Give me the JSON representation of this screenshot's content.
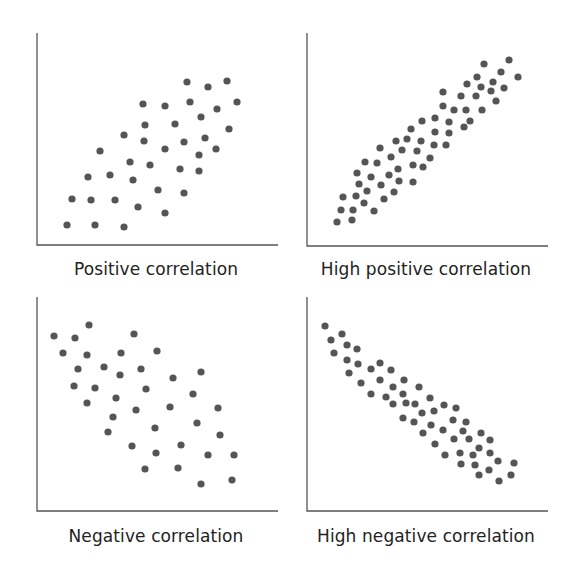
{
  "chart_data": [
    {
      "type": "scatter",
      "title": "Positive correlation",
      "xlabel": "",
      "ylabel": "",
      "grid": false,
      "axes": {
        "origin": [
          37,
          245
        ],
        "x_end": 278,
        "y_top": 33
      },
      "label_pos": [
        156,
        259
      ],
      "points": [
        [
          187,
          82
        ],
        [
          208,
          87
        ],
        [
          227,
          81
        ],
        [
          143,
          104
        ],
        [
          165,
          106
        ],
        [
          190,
          102
        ],
        [
          217,
          109
        ],
        [
          237,
          102
        ],
        [
          145,
          125
        ],
        [
          175,
          124
        ],
        [
          201,
          117
        ],
        [
          229,
          129
        ],
        [
          124,
          135
        ],
        [
          144,
          141
        ],
        [
          184,
          142
        ],
        [
          205,
          138
        ],
        [
          100,
          151
        ],
        [
          165,
          149
        ],
        [
          199,
          155
        ],
        [
          216,
          149
        ],
        [
          130,
          162
        ],
        [
          150,
          165
        ],
        [
          180,
          169
        ],
        [
          199,
          171
        ],
        [
          88,
          177
        ],
        [
          110,
          175
        ],
        [
          133,
          180
        ],
        [
          158,
          190
        ],
        [
          184,
          193
        ],
        [
          72,
          199
        ],
        [
          91,
          200
        ],
        [
          115,
          200
        ],
        [
          138,
          207
        ],
        [
          165,
          213
        ],
        [
          67,
          225
        ],
        [
          95,
          225
        ],
        [
          124,
          227
        ]
      ]
    },
    {
      "type": "scatter",
      "title": "High positive correlation",
      "xlabel": "",
      "ylabel": "",
      "grid": false,
      "axes": {
        "origin": [
          307,
          246
        ],
        "x_end": 548,
        "y_top": 33
      },
      "label_pos": [
        426,
        259
      ],
      "points": [
        [
          484,
          64
        ],
        [
          509,
          60
        ],
        [
          501,
          72
        ],
        [
          518,
          77
        ],
        [
          477,
          77
        ],
        [
          493,
          82
        ],
        [
          467,
          84
        ],
        [
          481,
          87
        ],
        [
          491,
          91
        ],
        [
          504,
          88
        ],
        [
          443,
          92
        ],
        [
          461,
          96
        ],
        [
          476,
          96
        ],
        [
          496,
          101
        ],
        [
          443,
          106
        ],
        [
          454,
          110
        ],
        [
          466,
          110
        ],
        [
          482,
          110
        ],
        [
          435,
          118
        ],
        [
          422,
          121
        ],
        [
          449,
          122
        ],
        [
          470,
          121
        ],
        [
          464,
          127
        ],
        [
          411,
          129
        ],
        [
          435,
          132
        ],
        [
          449,
          133
        ],
        [
          396,
          141
        ],
        [
          407,
          139
        ],
        [
          421,
          141
        ],
        [
          434,
          145
        ],
        [
          446,
          145
        ],
        [
          380,
          148
        ],
        [
          402,
          150
        ],
        [
          417,
          151
        ],
        [
          391,
          157
        ],
        [
          430,
          158
        ],
        [
          365,
          162
        ],
        [
          377,
          163
        ],
        [
          413,
          165
        ],
        [
          423,
          167
        ],
        [
          398,
          169
        ],
        [
          357,
          173
        ],
        [
          389,
          175
        ],
        [
          371,
          177
        ],
        [
          399,
          181
        ],
        [
          413,
          182
        ],
        [
          359,
          184
        ],
        [
          381,
          185
        ],
        [
          367,
          191
        ],
        [
          394,
          192
        ],
        [
          343,
          197
        ],
        [
          356,
          196
        ],
        [
          384,
          199
        ],
        [
          364,
          203
        ],
        [
          341,
          210
        ],
        [
          353,
          210
        ],
        [
          374,
          211
        ],
        [
          337,
          222
        ],
        [
          352,
          220
        ]
      ]
    },
    {
      "type": "scatter",
      "title": "Negative correlation",
      "xlabel": "",
      "ylabel": "",
      "grid": false,
      "axes": {
        "origin": [
          37,
          511
        ],
        "x_end": 278,
        "y_top": 297
      },
      "label_pos": [
        156,
        526
      ],
      "points": [
        [
          89,
          325
        ],
        [
          54,
          336
        ],
        [
          75,
          338
        ],
        [
          134,
          334
        ],
        [
          63,
          353
        ],
        [
          87,
          355
        ],
        [
          121,
          353
        ],
        [
          157,
          351
        ],
        [
          78,
          369
        ],
        [
          104,
          367
        ],
        [
          120,
          375
        ],
        [
          141,
          369
        ],
        [
          173,
          378
        ],
        [
          201,
          372
        ],
        [
          74,
          386
        ],
        [
          95,
          388
        ],
        [
          146,
          389
        ],
        [
          193,
          394
        ],
        [
          87,
          403
        ],
        [
          116,
          398
        ],
        [
          170,
          407
        ],
        [
          218,
          408
        ],
        [
          113,
          417
        ],
        [
          136,
          410
        ],
        [
          197,
          423
        ],
        [
          108,
          432
        ],
        [
          155,
          428
        ],
        [
          220,
          435
        ],
        [
          132,
          446
        ],
        [
          181,
          445
        ],
        [
          156,
          453
        ],
        [
          208,
          455
        ],
        [
          234,
          455
        ],
        [
          145,
          469
        ],
        [
          178,
          468
        ],
        [
          201,
          484
        ],
        [
          232,
          480
        ]
      ]
    },
    {
      "type": "scatter",
      "title": "High negative correlation",
      "xlabel": "",
      "ylabel": "",
      "grid": false,
      "axes": {
        "origin": [
          307,
          511
        ],
        "x_end": 548,
        "y_top": 297
      },
      "label_pos": [
        426,
        526
      ],
      "points": [
        [
          325,
          326
        ],
        [
          342,
          334
        ],
        [
          331,
          340
        ],
        [
          347,
          345
        ],
        [
          357,
          349
        ],
        [
          334,
          353
        ],
        [
          347,
          360
        ],
        [
          358,
          364
        ],
        [
          380,
          363
        ],
        [
          371,
          369
        ],
        [
          391,
          370
        ],
        [
          349,
          373
        ],
        [
          380,
          380
        ],
        [
          404,
          380
        ],
        [
          361,
          383
        ],
        [
          393,
          387
        ],
        [
          419,
          387
        ],
        [
          371,
          394
        ],
        [
          386,
          397
        ],
        [
          403,
          394
        ],
        [
          430,
          398
        ],
        [
          393,
          404
        ],
        [
          406,
          403
        ],
        [
          415,
          404
        ],
        [
          444,
          405
        ],
        [
          456,
          408
        ],
        [
          422,
          413
        ],
        [
          434,
          411
        ],
        [
          403,
          418
        ],
        [
          414,
          422
        ],
        [
          453,
          420
        ],
        [
          466,
          422
        ],
        [
          431,
          425
        ],
        [
          443,
          430
        ],
        [
          463,
          431
        ],
        [
          481,
          433
        ],
        [
          423,
          433
        ],
        [
          454,
          439
        ],
        [
          469,
          439
        ],
        [
          490,
          440
        ],
        [
          435,
          444
        ],
        [
          479,
          448
        ],
        [
          445,
          455
        ],
        [
          460,
          453
        ],
        [
          473,
          455
        ],
        [
          490,
          453
        ],
        [
          461,
          464
        ],
        [
          475,
          465
        ],
        [
          498,
          461
        ],
        [
          514,
          463
        ],
        [
          479,
          475
        ],
        [
          489,
          470
        ],
        [
          511,
          475
        ],
        [
          499,
          481
        ]
      ]
    }
  ],
  "style": {
    "dot_color": "#555555",
    "axis_color": "#555555",
    "dot_radius": 3.6
  }
}
